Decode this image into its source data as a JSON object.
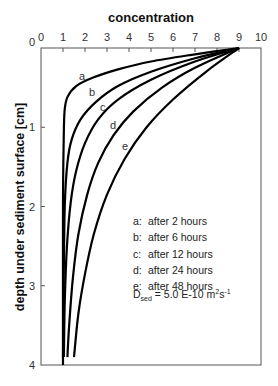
{
  "chart_data": {
    "type": "line",
    "title": "concentration",
    "xlabel": "concentration",
    "ylabel": "depth under sediment surface [cm]",
    "xlim": [
      0,
      10
    ],
    "ylim": [
      4,
      0
    ],
    "x_ticks": [
      "0",
      "1",
      "2",
      "3",
      "4",
      "5",
      "6",
      "7",
      "8",
      "9",
      "10"
    ],
    "y_ticks": [
      "0",
      "1",
      "2",
      "3",
      "4"
    ],
    "grid": false,
    "series": [
      {
        "name": "a",
        "label": "after 2 hours",
        "points": [
          [
            9,
            0
          ],
          [
            7,
            0.08
          ],
          [
            5,
            0.17
          ],
          [
            3.5,
            0.27
          ],
          [
            2.4,
            0.37
          ],
          [
            1.6,
            0.48
          ],
          [
            1.2,
            0.62
          ],
          [
            1.07,
            0.8
          ],
          [
            1.03,
            1.2
          ],
          [
            1.0,
            2.0
          ],
          [
            1.0,
            4.0
          ]
        ]
      },
      {
        "name": "b",
        "label": "after 6 hours",
        "points": [
          [
            9,
            0
          ],
          [
            7,
            0.13
          ],
          [
            5,
            0.3
          ],
          [
            3.5,
            0.48
          ],
          [
            2.5,
            0.68
          ],
          [
            1.8,
            0.9
          ],
          [
            1.4,
            1.15
          ],
          [
            1.2,
            1.45
          ],
          [
            1.08,
            2.0
          ],
          [
            1.03,
            3.0
          ],
          [
            1.0,
            3.9
          ]
        ]
      },
      {
        "name": "c",
        "label": "after 12 hours",
        "points": [
          [
            9,
            0
          ],
          [
            7,
            0.17
          ],
          [
            5,
            0.4
          ],
          [
            3.5,
            0.65
          ],
          [
            2.6,
            0.9
          ],
          [
            2.0,
            1.2
          ],
          [
            1.6,
            1.55
          ],
          [
            1.35,
            1.95
          ],
          [
            1.18,
            2.5
          ],
          [
            1.08,
            3.2
          ],
          [
            1.04,
            3.9
          ]
        ]
      },
      {
        "name": "d",
        "label": "after 24 hours",
        "points": [
          [
            9,
            0
          ],
          [
            7,
            0.25
          ],
          [
            5.5,
            0.5
          ],
          [
            4.2,
            0.8
          ],
          [
            3.3,
            1.1
          ],
          [
            2.6,
            1.45
          ],
          [
            2.1,
            1.85
          ],
          [
            1.7,
            2.35
          ],
          [
            1.45,
            2.9
          ],
          [
            1.28,
            3.5
          ],
          [
            1.2,
            3.9
          ]
        ]
      },
      {
        "name": "e",
        "label": "after 48 hours",
        "points": [
          [
            9,
            0
          ],
          [
            7.5,
            0.3
          ],
          [
            6,
            0.65
          ],
          [
            4.8,
            1.0
          ],
          [
            3.8,
            1.4
          ],
          [
            3.0,
            1.85
          ],
          [
            2.4,
            2.35
          ],
          [
            2.0,
            2.85
          ],
          [
            1.7,
            3.35
          ],
          [
            1.5,
            3.9
          ]
        ]
      }
    ],
    "annotation": "D_sed = 5.0 E-10 m²s⁻¹"
  },
  "legend": {
    "items": [
      {
        "key": "a:",
        "text": "after 2 hours"
      },
      {
        "key": "b:",
        "text": "after 6 hours"
      },
      {
        "key": "c:",
        "text": "after 12 hours"
      },
      {
        "key": "d:",
        "text": "after 24 hours"
      },
      {
        "key": "e:",
        "text": "after 48 hours"
      }
    ],
    "diffusion": {
      "symbol": "D",
      "sub": "sed",
      "value": " = 5.0 E-10 m",
      "sup1": "2",
      "mid": "s",
      "sup2": "-1"
    }
  },
  "labels": {
    "title": "concentration",
    "ylabel": "depth under sediment surface [cm]",
    "curve_letters": [
      "a",
      "b",
      "c",
      "d",
      "e"
    ]
  }
}
